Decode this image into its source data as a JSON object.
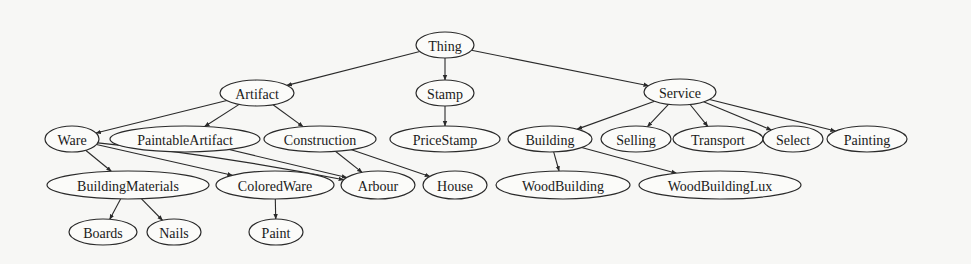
{
  "diagram": {
    "type": "tree",
    "title": "",
    "nodes": [
      {
        "id": "Thing",
        "label": "Thing",
        "cx": 445,
        "cy": 45,
        "rx": 29,
        "ry": 13
      },
      {
        "id": "Artifact",
        "label": "Artifact",
        "cx": 257,
        "cy": 93,
        "rx": 37,
        "ry": 13
      },
      {
        "id": "Stamp",
        "label": "Stamp",
        "cx": 445,
        "cy": 93,
        "rx": 29,
        "ry": 13
      },
      {
        "id": "Service",
        "label": "Service",
        "cx": 680,
        "cy": 92,
        "rx": 36,
        "ry": 13
      },
      {
        "id": "Ware",
        "label": "Ware",
        "cx": 72,
        "cy": 139,
        "rx": 27,
        "ry": 13
      },
      {
        "id": "PaintableArtifact",
        "label": "PaintableArtifact",
        "cx": 185,
        "cy": 139,
        "rx": 75,
        "ry": 13
      },
      {
        "id": "Construction",
        "label": "Construction",
        "cx": 320,
        "cy": 139,
        "rx": 56,
        "ry": 13
      },
      {
        "id": "PriceStamp",
        "label": "PriceStamp",
        "cx": 445,
        "cy": 139,
        "rx": 55,
        "ry": 13
      },
      {
        "id": "Building",
        "label": "Building",
        "cx": 550,
        "cy": 139,
        "rx": 42,
        "ry": 13
      },
      {
        "id": "Selling",
        "label": "Selling",
        "cx": 636,
        "cy": 139,
        "rx": 35,
        "ry": 13
      },
      {
        "id": "Transport",
        "label": "Transport",
        "cx": 718,
        "cy": 139,
        "rx": 45,
        "ry": 13
      },
      {
        "id": "Select",
        "label": "Select",
        "cx": 793,
        "cy": 139,
        "rx": 30,
        "ry": 13
      },
      {
        "id": "Painting",
        "label": "Painting",
        "cx": 867,
        "cy": 139,
        "rx": 40,
        "ry": 13
      },
      {
        "id": "BuildingMaterials",
        "label": "BuildingMaterials",
        "cx": 128,
        "cy": 185,
        "rx": 81,
        "ry": 14
      },
      {
        "id": "ColoredWare",
        "label": "ColoredWare",
        "cx": 275,
        "cy": 185,
        "rx": 59,
        "ry": 14
      },
      {
        "id": "Arbour",
        "label": "Arbour",
        "cx": 378,
        "cy": 185,
        "rx": 37,
        "ry": 14
      },
      {
        "id": "House",
        "label": "House",
        "cx": 455,
        "cy": 185,
        "rx": 32,
        "ry": 14
      },
      {
        "id": "WoodBuilding",
        "label": "WoodBuilding",
        "cx": 563,
        "cy": 185,
        "rx": 67,
        "ry": 14
      },
      {
        "id": "WoodBuildingLux",
        "label": "WoodBuildingLux",
        "cx": 720,
        "cy": 185,
        "rx": 81,
        "ry": 14
      },
      {
        "id": "Boards",
        "label": "Boards",
        "cx": 103,
        "cy": 232,
        "rx": 34,
        "ry": 13
      },
      {
        "id": "Nails",
        "label": "Nails",
        "cx": 174,
        "cy": 232,
        "rx": 27,
        "ry": 13
      },
      {
        "id": "Paint",
        "label": "Paint",
        "cx": 276,
        "cy": 232,
        "rx": 27,
        "ry": 13
      }
    ],
    "edges": [
      {
        "from": "Thing",
        "to": "Artifact"
      },
      {
        "from": "Thing",
        "to": "Stamp"
      },
      {
        "from": "Thing",
        "to": "Service"
      },
      {
        "from": "Artifact",
        "to": "Ware"
      },
      {
        "from": "Artifact",
        "to": "PaintableArtifact"
      },
      {
        "from": "Artifact",
        "to": "Construction"
      },
      {
        "from": "Stamp",
        "to": "PriceStamp"
      },
      {
        "from": "Service",
        "to": "Building"
      },
      {
        "from": "Service",
        "to": "Selling"
      },
      {
        "from": "Service",
        "to": "Transport"
      },
      {
        "from": "Service",
        "to": "Select"
      },
      {
        "from": "Service",
        "to": "Painting"
      },
      {
        "from": "Ware",
        "to": "BuildingMaterials"
      },
      {
        "from": "Ware",
        "to": "ColoredWare"
      },
      {
        "from": "Ware",
        "to": "Arbour"
      },
      {
        "from": "PaintableArtifact",
        "to": "Arbour"
      },
      {
        "from": "Construction",
        "to": "Arbour"
      },
      {
        "from": "Construction",
        "to": "House"
      },
      {
        "from": "Building",
        "to": "WoodBuilding"
      },
      {
        "from": "Building",
        "to": "WoodBuildingLux"
      },
      {
        "from": "BuildingMaterials",
        "to": "Boards"
      },
      {
        "from": "BuildingMaterials",
        "to": "Nails"
      },
      {
        "from": "ColoredWare",
        "to": "Paint"
      }
    ]
  },
  "colors": {
    "background": "#f7f7f5",
    "stroke": "#2a2a2a",
    "node_fill": "#fbfbf9",
    "text": "#1a1a1a"
  }
}
